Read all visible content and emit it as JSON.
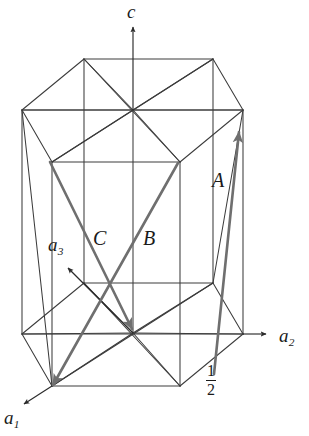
{
  "figure": {
    "kind": "hexagonal-unit-cell-diagram",
    "background_color": "#ffffff",
    "line_color": "#3c3c3c",
    "vector_color": "#6b6b6b",
    "text_color": "#1a1a1a"
  },
  "axes": [
    {
      "id": "c",
      "label": "c",
      "sub": "",
      "label_x": 127,
      "label_y": 2,
      "tail": [
        133,
        162
      ],
      "tip": [
        133,
        27
      ]
    },
    {
      "id": "a2",
      "label": "a",
      "sub": "2",
      "label_x": 279,
      "label_y": 326,
      "tail": [
        243,
        334
      ],
      "tip": [
        266,
        334
      ]
    },
    {
      "id": "a3",
      "label": "a",
      "sub": "3",
      "label_x": 48,
      "label_y": 235,
      "tail": [
        133,
        333
      ],
      "tip": [
        68,
        268
      ]
    },
    {
      "id": "a1",
      "label": "a",
      "sub": "1",
      "label_x": 4,
      "label_y": 408,
      "tail": [
        52,
        386
      ],
      "tip": [
        24,
        404
      ]
    }
  ],
  "vectors": [
    {
      "id": "A",
      "label": "A",
      "label_x": 212,
      "label_y": 170,
      "tail": [
        214,
        374
      ],
      "tip": [
        239,
        132
      ]
    },
    {
      "id": "B",
      "label": "B",
      "label_x": 143,
      "label_y": 228,
      "tail": [
        178,
        163
      ],
      "tip": [
        53,
        385
      ]
    },
    {
      "id": "C",
      "label": "C",
      "label_x": 93,
      "label_y": 228,
      "tail": [
        50,
        162
      ],
      "tip": [
        132,
        329
      ]
    }
  ],
  "annotations": [
    {
      "id": "half-fraction",
      "numerator": "1",
      "denominator": "2",
      "x": 206,
      "y": 363
    }
  ],
  "cell": {
    "top_hexagon": [
      [
        22,
        110
      ],
      [
        84,
        59
      ],
      [
        213,
        59
      ],
      [
        243,
        110
      ],
      [
        180,
        162
      ],
      [
        52,
        162
      ]
    ],
    "bottom_hexagon": [
      [
        22,
        334
      ],
      [
        84,
        283
      ],
      [
        213,
        283
      ],
      [
        243,
        334
      ],
      [
        180,
        386
      ],
      [
        52,
        386
      ]
    ],
    "top_center": [
      133,
      110
    ],
    "bottom_center": [
      133,
      333
    ],
    "vertical_edge_indices": [
      0,
      1,
      2,
      3,
      4,
      5
    ]
  }
}
